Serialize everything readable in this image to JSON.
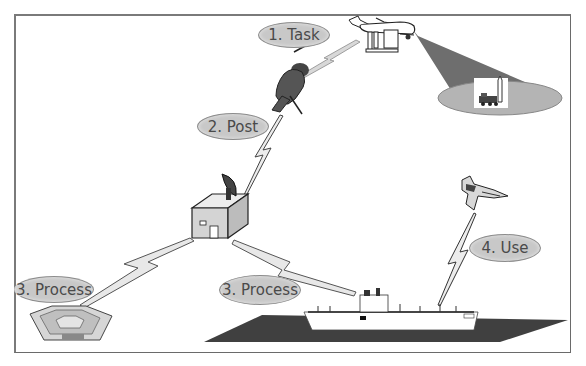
{
  "diagram": {
    "type": "ISR task-post-process-use cycle",
    "colors": {
      "label_fill": "#c8c8c8",
      "label_border": "#8c8c8c",
      "label_text": "#4a4a4a",
      "link_fill": "#e4e4e4",
      "link_stroke": "#555555",
      "sensor_beam": "#6e6e6e",
      "sensor_footprint": "#b4b4b4",
      "ocean": "#404040",
      "frame": "#6a6a6a"
    },
    "labels": [
      {
        "id": "task",
        "text": "1. Task"
      },
      {
        "id": "post",
        "text": "2. Post"
      },
      {
        "id": "process-left",
        "text": "3. Process"
      },
      {
        "id": "process-center",
        "text": "3. Process"
      },
      {
        "id": "use",
        "text": "4. Use"
      }
    ],
    "nodes": [
      {
        "id": "uav",
        "name": "UAV sensor aircraft"
      },
      {
        "id": "sensor-footprint",
        "name": "Sensor footprint with target (missile launcher)"
      },
      {
        "id": "soldier",
        "name": "Ground soldier with antenna"
      },
      {
        "id": "ground-station",
        "name": "Ground station shelter with satellite dish"
      },
      {
        "id": "pentagon",
        "name": "Pentagon headquarters"
      },
      {
        "id": "ship",
        "name": "Aircraft carrier / command ship"
      },
      {
        "id": "fighter",
        "name": "Fighter jet"
      }
    ],
    "links": [
      {
        "from": "uav",
        "to": "soldier"
      },
      {
        "from": "soldier",
        "to": "ground-station"
      },
      {
        "from": "ground-station",
        "to": "pentagon"
      },
      {
        "from": "ground-station",
        "to": "ship"
      },
      {
        "from": "ship",
        "to": "fighter"
      }
    ]
  }
}
